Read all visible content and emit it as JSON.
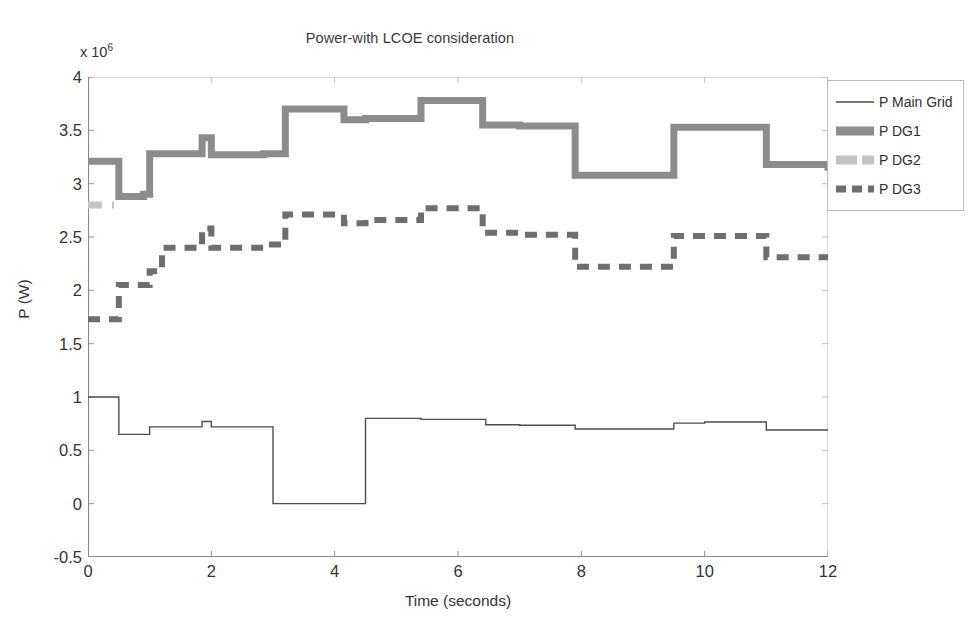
{
  "chart_data": {
    "type": "line",
    "title": "Power-with LCOE consideration",
    "xlabel": "Time (seconds)",
    "ylabel": "P (W)",
    "y_exponent_label": "x 10",
    "y_exponent_power": "6",
    "xlim": [
      0,
      12
    ],
    "ylim": [
      -0.5,
      4
    ],
    "xticks": [
      0,
      2,
      4,
      6,
      8,
      10,
      12
    ],
    "xtick_labels": [
      "0",
      "2",
      "4",
      "6",
      "8",
      "10",
      "12"
    ],
    "yticks": [
      -0.5,
      0,
      0.5,
      1,
      1.5,
      2,
      2.5,
      3,
      3.5,
      4
    ],
    "ytick_labels": [
      "-0.5",
      "0",
      "0.5",
      "1",
      "1.5",
      "2",
      "2.5",
      "3",
      "3.5",
      "4"
    ],
    "y_scale_note": "values in millions of watts (x 10^6)",
    "grid": false,
    "legend_position": "upper-right-outside",
    "colors": {
      "main_grid": "#4d4d4d",
      "dg1": "#8c8c8c",
      "dg2": "#c4c4c4",
      "dg3": "#6e6e6e",
      "axis": "#888888",
      "legend_border": "#b9b9b9",
      "background": "#ffffff"
    },
    "series": [
      {
        "name": "P Main Grid",
        "style": "solid",
        "width": 1.4,
        "color": "#4d4d4d",
        "steps": [
          [
            0.0,
            1.0
          ],
          [
            0.5,
            1.0
          ],
          [
            0.5,
            0.65
          ],
          [
            1.0,
            0.65
          ],
          [
            1.0,
            0.72
          ],
          [
            1.85,
            0.72
          ],
          [
            1.85,
            0.77
          ],
          [
            2.0,
            0.77
          ],
          [
            2.0,
            0.72
          ],
          [
            3.0,
            0.72
          ],
          [
            3.0,
            0.0
          ],
          [
            4.5,
            0.0
          ],
          [
            4.5,
            0.8
          ],
          [
            5.4,
            0.8
          ],
          [
            5.4,
            0.79
          ],
          [
            6.45,
            0.79
          ],
          [
            6.45,
            0.74
          ],
          [
            7.0,
            0.74
          ],
          [
            7.0,
            0.735
          ],
          [
            7.9,
            0.735
          ],
          [
            7.9,
            0.7
          ],
          [
            9.5,
            0.7
          ],
          [
            9.5,
            0.755
          ],
          [
            10.0,
            0.755
          ],
          [
            10.0,
            0.765
          ],
          [
            11.0,
            0.765
          ],
          [
            11.0,
            0.69
          ],
          [
            12.0,
            0.69
          ]
        ]
      },
      {
        "name": "P DG1",
        "style": "solid",
        "width": 7,
        "color": "#8c8c8c",
        "steps": [
          [
            0.0,
            3.21
          ],
          [
            0.5,
            3.21
          ],
          [
            0.5,
            2.88
          ],
          [
            0.9,
            2.88
          ],
          [
            0.9,
            2.9
          ],
          [
            1.0,
            2.9
          ],
          [
            1.0,
            3.28
          ],
          [
            1.85,
            3.28
          ],
          [
            1.85,
            3.43
          ],
          [
            2.0,
            3.43
          ],
          [
            2.0,
            3.27
          ],
          [
            2.85,
            3.27
          ],
          [
            2.85,
            3.28
          ],
          [
            3.2,
            3.28
          ],
          [
            3.2,
            3.7
          ],
          [
            4.15,
            3.7
          ],
          [
            4.15,
            3.6
          ],
          [
            4.5,
            3.6
          ],
          [
            4.5,
            3.61
          ],
          [
            5.4,
            3.61
          ],
          [
            5.4,
            3.78
          ],
          [
            6.4,
            3.78
          ],
          [
            6.4,
            3.55
          ],
          [
            7.0,
            3.55
          ],
          [
            7.0,
            3.54
          ],
          [
            7.9,
            3.54
          ],
          [
            7.9,
            3.08
          ],
          [
            9.5,
            3.08
          ],
          [
            9.5,
            3.53
          ],
          [
            11.0,
            3.53
          ],
          [
            11.0,
            3.18
          ],
          [
            12.0,
            3.18
          ],
          [
            12.0,
            3.12
          ]
        ]
      },
      {
        "name": "P DG2",
        "style": "dashed",
        "width": 7,
        "color": "#c4c4c4",
        "steps": [
          [
            0.0,
            2.8
          ],
          [
            0.22,
            2.8
          ],
          [
            0.3,
            2.8
          ],
          [
            0.42,
            2.8
          ]
        ],
        "note": "visible only as a short stub near t=0, otherwise overlapped"
      },
      {
        "name": "P DG3",
        "style": "dashed",
        "width": 6,
        "color": "#6e6e6e",
        "steps": [
          [
            0.0,
            1.73
          ],
          [
            0.5,
            1.73
          ],
          [
            0.5,
            2.05
          ],
          [
            1.0,
            2.05
          ],
          [
            1.0,
            2.18
          ],
          [
            1.2,
            2.18
          ],
          [
            1.2,
            2.4
          ],
          [
            1.85,
            2.4
          ],
          [
            1.85,
            2.58
          ],
          [
            2.0,
            2.58
          ],
          [
            2.0,
            2.4
          ],
          [
            2.85,
            2.4
          ],
          [
            2.85,
            2.43
          ],
          [
            3.2,
            2.43
          ],
          [
            3.2,
            2.71
          ],
          [
            4.15,
            2.71
          ],
          [
            4.15,
            2.63
          ],
          [
            4.5,
            2.63
          ],
          [
            4.5,
            2.66
          ],
          [
            5.4,
            2.66
          ],
          [
            5.4,
            2.77
          ],
          [
            6.4,
            2.77
          ],
          [
            6.4,
            2.54
          ],
          [
            7.0,
            2.54
          ],
          [
            7.0,
            2.52
          ],
          [
            7.9,
            2.52
          ],
          [
            7.9,
            2.22
          ],
          [
            9.5,
            2.22
          ],
          [
            9.5,
            2.51
          ],
          [
            11.0,
            2.51
          ],
          [
            11.0,
            2.31
          ],
          [
            12.0,
            2.31
          ],
          [
            12.0,
            2.27
          ]
        ]
      }
    ]
  },
  "legend": {
    "items": [
      {
        "label": "P Main Grid",
        "style": "solid-thin",
        "color": "#4d4d4d"
      },
      {
        "label": "P DG1",
        "style": "solid-thick",
        "color": "#8c8c8c"
      },
      {
        "label": "P DG2",
        "style": "dashed-thick-light",
        "color": "#c4c4c4"
      },
      {
        "label": "P DG3",
        "style": "dashed-thick-dark",
        "color": "#6e6e6e"
      }
    ]
  }
}
